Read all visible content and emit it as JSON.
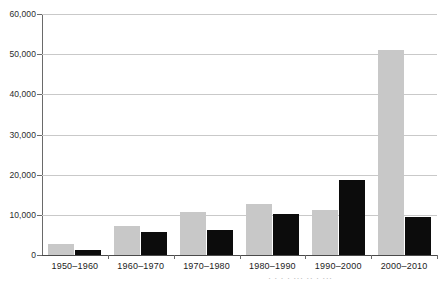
{
  "chart_data": {
    "type": "bar",
    "title": "",
    "subtitle": "",
    "xlabel": "",
    "ylabel": "",
    "categories": [
      "1950–1960",
      "1960–1970",
      "1970–1980",
      "1980–1990",
      "1990–2000",
      "2000–2010"
    ],
    "series": [
      {
        "name": "series-a",
        "color": "#c8c8c8",
        "values": [
          2700,
          7200,
          10600,
          12600,
          11200,
          51000
        ]
      },
      {
        "name": "series-b",
        "color": "#0c0c0c",
        "values": [
          1200,
          5700,
          6300,
          10100,
          18800,
          9500
        ]
      }
    ],
    "ylim": [
      0,
      60000
    ],
    "ytick_values": [
      0,
      10000,
      20000,
      30000,
      40000,
      50000,
      60000
    ],
    "ytick_labels": [
      "0",
      "10,000",
      "20,000",
      "30,000",
      "40,000",
      "50,000",
      "60,000"
    ],
    "grid": true,
    "grid_axis": "y",
    "legend": false,
    "legend_position": "none",
    "annotations": []
  },
  "axis": {
    "y_axis_line_color": "#6a6a6a",
    "gridline_color": "#c9c9c9",
    "baseline_color": "#4a4a4a",
    "x_tick_color": "#6a6a6a"
  },
  "artifact": {
    "cropped_text": "· · ·  · ···  ··  · ···"
  }
}
